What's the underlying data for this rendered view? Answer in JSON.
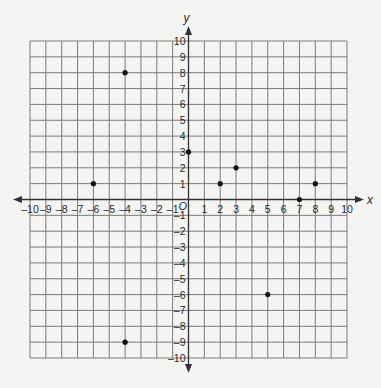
{
  "chart_data": {
    "type": "scatter",
    "title": "",
    "xlabel": "x",
    "ylabel": "y",
    "origin_label": "O",
    "xlim": [
      -10,
      10
    ],
    "ylim": [
      -10,
      10
    ],
    "grid": true,
    "x_ticks": [
      -10,
      -9,
      -8,
      -7,
      -6,
      -5,
      -4,
      -3,
      -2,
      -1,
      1,
      2,
      3,
      4,
      5,
      6,
      7,
      8,
      9,
      10
    ],
    "y_ticks": [
      -10,
      -9,
      -8,
      -7,
      -6,
      -5,
      -4,
      -3,
      -2,
      -1,
      1,
      2,
      3,
      4,
      5,
      6,
      7,
      8,
      9,
      10
    ],
    "points": [
      {
        "x": -4,
        "y": 8
      },
      {
        "x": -6,
        "y": 1
      },
      {
        "x": 0,
        "y": 3
      },
      {
        "x": 2,
        "y": 1
      },
      {
        "x": 3,
        "y": 2
      },
      {
        "x": 7,
        "y": 0
      },
      {
        "x": 8,
        "y": 1
      },
      {
        "x": 5,
        "y": -6
      },
      {
        "x": -4,
        "y": -9
      }
    ],
    "legend": null
  },
  "colors": {
    "background": "#f4f4f3",
    "grid": "#7a7a7a",
    "axis": "#333333",
    "point": "#111111"
  }
}
